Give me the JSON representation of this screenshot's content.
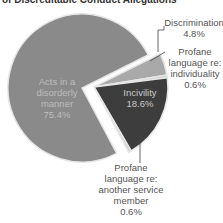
{
  "chart_data": {
    "type": "pie",
    "title": "of Discreditable Conduct Allegations",
    "slices": [
      {
        "label": "Acts in a disorderly manner",
        "value": 75.4,
        "value_label": "75.4%",
        "color": "#8a8a8a",
        "exploded": false
      },
      {
        "label": "Discrimination",
        "value": 4.8,
        "value_label": "4.8%",
        "color": "#a9a9a9",
        "exploded": true
      },
      {
        "label": "Profane language re: individuality",
        "value": 0.6,
        "value_label": "0.6%",
        "color": "#d4d4d4",
        "exploded": true
      },
      {
        "label": "Incivility",
        "value": 18.6,
        "value_label": "18.6%",
        "color": "#3d3d3d",
        "exploded": true
      },
      {
        "label": "Profane language re: another service member",
        "value": 0.6,
        "value_label": "0.6%",
        "color": "#d4d4d4",
        "exploded": true
      }
    ],
    "label_lines": {
      "main": [
        "Acts in a",
        "disorderly",
        "manner",
        "75.4%"
      ],
      "discrimination": [
        "Discrimination",
        "4.8%"
      ],
      "profane_individuality": [
        "Profane",
        "language re:",
        "individuality",
        "0.6%"
      ],
      "incivility": [
        "Incivility",
        "18.6%"
      ],
      "profane_service": [
        "Profane",
        "language re:",
        "another service",
        "member",
        "0.6%"
      ]
    }
  }
}
